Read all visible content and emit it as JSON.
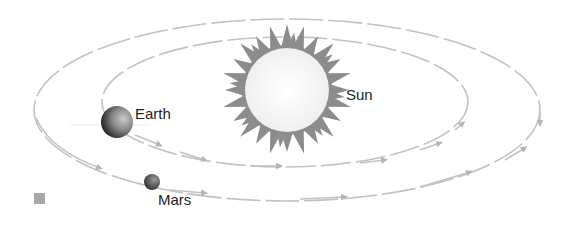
{
  "diagram": {
    "labels": {
      "sun": "Sun",
      "earth": "Earth",
      "mars": "Mars"
    },
    "colors": {
      "orbit": "#b8b8b8",
      "sun_rays": "#8a8a8a",
      "sun_body": "#f7f7f7",
      "earth_dark": "#2a2a2a",
      "earth_light": "#b0b0b0",
      "mars": "#4a4a4a",
      "legend_square": "#a8a8a8"
    },
    "bodies": [
      {
        "name": "Sun",
        "type": "star"
      },
      {
        "name": "Earth",
        "type": "planet",
        "orbit": "inner"
      },
      {
        "name": "Mars",
        "type": "planet",
        "orbit": "outer"
      }
    ],
    "legend": {
      "marker": "gray-square"
    }
  }
}
